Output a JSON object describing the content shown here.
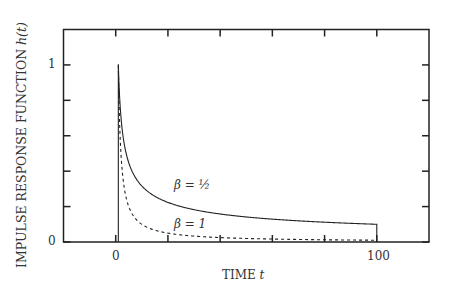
{
  "chart_data": {
    "type": "line",
    "title": "",
    "xlabel": "TIME t",
    "ylabel": "IMPULSE RESPONSE FUNCTION h(t)",
    "xlim": [
      -20,
      120
    ],
    "ylim": [
      0,
      1.2
    ],
    "x_ticks": [
      0,
      20,
      40,
      60,
      80,
      100
    ],
    "x_tick_labels": {
      "0": "0",
      "100": "100"
    },
    "y_ticks": [
      0,
      0.2,
      0.4,
      0.6,
      0.8,
      1.0
    ],
    "y_tick_labels": {
      "0": "0",
      "1": "1"
    },
    "grid": false,
    "legend": "inline annotations",
    "series": [
      {
        "name": "β = 1/2",
        "style": "solid",
        "formula": "h(t) = t^(-1/2) for 1 ≤ t ≤ 100, else 0",
        "x": [
          1,
          2,
          5,
          10,
          20,
          40,
          60,
          80,
          100
        ],
        "values": [
          1.0,
          0.707,
          0.447,
          0.316,
          0.224,
          0.158,
          0.129,
          0.112,
          0.1
        ]
      },
      {
        "name": "β = 1",
        "style": "dashed",
        "formula": "h(t) = t^(-1) for 1 ≤ t ≤ 100, else 0",
        "x": [
          1,
          2,
          5,
          10,
          20,
          40,
          60,
          80,
          100
        ],
        "values": [
          1.0,
          0.5,
          0.2,
          0.1,
          0.05,
          0.025,
          0.017,
          0.0125,
          0.01
        ]
      }
    ],
    "annotations": [
      {
        "text": "β = ½",
        "x": 24,
        "y": 0.3
      },
      {
        "text": "β = 1",
        "x": 24,
        "y": 0.08
      }
    ]
  },
  "labels": {
    "xlabel_text": "TIME ",
    "xlabel_var": "t",
    "ylabel_text": "IMPULSE RESPONSE FUNCTION ",
    "ylabel_var": "h(t)",
    "xtick_0": "0",
    "xtick_100": "100",
    "ytick_0": "0",
    "ytick_1": "1",
    "ann_half": "β = ½",
    "ann_one": "β = 1"
  }
}
